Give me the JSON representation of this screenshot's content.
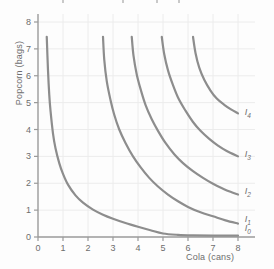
{
  "chart_data": {
    "type": "line",
    "title": "",
    "subtitle": "",
    "xlabel": "Cola (cans)",
    "ylabel": "Popcorn (bags)",
    "xlim": [
      0,
      8.6
    ],
    "ylim": [
      0,
      8.4
    ],
    "xticks": [
      0,
      1,
      2,
      3,
      4,
      5,
      6,
      7,
      8
    ],
    "yticks": [
      0,
      1,
      2,
      3,
      4,
      5,
      6,
      7,
      8
    ],
    "xticklabels": [
      "0",
      "1",
      "2",
      "3",
      "4",
      "5",
      "6",
      "7",
      "8"
    ],
    "yticklabels": [
      "0",
      "1",
      "2",
      "3",
      "4",
      "5",
      "6",
      "7",
      "8"
    ],
    "grid": true,
    "legend_position": "right-inline-labels",
    "curve_color": "#8d8d8d",
    "grid_color": "#ececec",
    "axis_color": "#9a9a9a",
    "text_color": "#6d6d6d",
    "background": "#fdfdfd",
    "series": [
      {
        "name": "I0",
        "label": "I",
        "subscript": "0",
        "label_x": 8.15,
        "label_y": 0.28,
        "points": [
          [
            0.35,
            7.45
          ],
          [
            0.4,
            6.2
          ],
          [
            0.45,
            5.3
          ],
          [
            0.5,
            4.7
          ],
          [
            0.6,
            3.85
          ],
          [
            0.7,
            3.3
          ],
          [
            0.85,
            2.75
          ],
          [
            1.0,
            2.35
          ],
          [
            1.2,
            1.95
          ],
          [
            1.5,
            1.55
          ],
          [
            1.8,
            1.28
          ],
          [
            2.2,
            1.02
          ],
          [
            2.6,
            0.83
          ],
          [
            3.0,
            0.68
          ],
          [
            3.5,
            0.52
          ],
          [
            4.0,
            0.38
          ],
          [
            4.5,
            0.25
          ],
          [
            5.0,
            0.13
          ],
          [
            5.6,
            0.08
          ],
          [
            6.2,
            0.06
          ],
          [
            7.0,
            0.05
          ],
          [
            8.0,
            0.05
          ]
        ]
      },
      {
        "name": "I1",
        "label": "I",
        "subscript": "1",
        "label_x": 8.15,
        "label_y": 0.62,
        "points": [
          [
            2.6,
            7.45
          ],
          [
            2.65,
            6.6
          ],
          [
            2.75,
            5.8
          ],
          [
            2.9,
            5.1
          ],
          [
            3.05,
            4.55
          ],
          [
            3.25,
            4.0
          ],
          [
            3.5,
            3.5
          ],
          [
            3.8,
            3.0
          ],
          [
            4.1,
            2.6
          ],
          [
            4.45,
            2.2
          ],
          [
            4.8,
            1.88
          ],
          [
            5.2,
            1.58
          ],
          [
            5.6,
            1.33
          ],
          [
            6.0,
            1.12
          ],
          [
            6.5,
            0.92
          ],
          [
            7.0,
            0.77
          ],
          [
            7.5,
            0.62
          ],
          [
            8.0,
            0.5
          ]
        ]
      },
      {
        "name": "I2",
        "label": "I",
        "subscript": "2",
        "label_x": 8.15,
        "label_y": 1.68,
        "points": [
          [
            3.75,
            7.45
          ],
          [
            3.82,
            6.75
          ],
          [
            3.95,
            6.05
          ],
          [
            4.12,
            5.45
          ],
          [
            4.3,
            4.92
          ],
          [
            4.55,
            4.38
          ],
          [
            4.8,
            3.95
          ],
          [
            5.1,
            3.5
          ],
          [
            5.45,
            3.08
          ],
          [
            5.8,
            2.75
          ],
          [
            6.2,
            2.45
          ],
          [
            6.6,
            2.2
          ],
          [
            7.0,
            1.98
          ],
          [
            7.4,
            1.8
          ],
          [
            7.7,
            1.68
          ],
          [
            8.0,
            1.58
          ]
        ]
      },
      {
        "name": "I3",
        "label": "I",
        "subscript": "3",
        "label_x": 8.15,
        "label_y": 3.05,
        "points": [
          [
            4.95,
            7.45
          ],
          [
            5.05,
            6.8
          ],
          [
            5.2,
            6.2
          ],
          [
            5.4,
            5.65
          ],
          [
            5.62,
            5.15
          ],
          [
            5.9,
            4.7
          ],
          [
            6.2,
            4.28
          ],
          [
            6.5,
            3.95
          ],
          [
            6.85,
            3.65
          ],
          [
            7.2,
            3.4
          ],
          [
            7.55,
            3.2
          ],
          [
            8.0,
            3.0
          ]
        ]
      },
      {
        "name": "I4",
        "label": "I",
        "subscript": "4",
        "label_x": 8.15,
        "label_y": 4.62,
        "points": [
          [
            6.2,
            7.45
          ],
          [
            6.3,
            6.85
          ],
          [
            6.45,
            6.3
          ],
          [
            6.65,
            5.85
          ],
          [
            6.9,
            5.45
          ],
          [
            7.15,
            5.15
          ],
          [
            7.45,
            4.92
          ],
          [
            7.72,
            4.75
          ],
          [
            8.0,
            4.6
          ]
        ]
      }
    ]
  },
  "chart": {
    "ylabel": "Popcorn (bags)",
    "xlabel": "Cola (cans)"
  }
}
